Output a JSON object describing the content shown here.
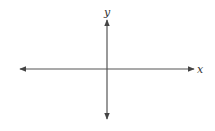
{
  "diagram": {
    "type": "cartesian-axes",
    "x_axis": {
      "label": "x",
      "from": [
        20,
        69
      ],
      "to": [
        194,
        69
      ],
      "arrows": "both"
    },
    "y_axis": {
      "label": "y",
      "from": [
        107,
        119
      ],
      "to": [
        107,
        20
      ],
      "arrows": "both"
    },
    "colors": {
      "axis": "#555555",
      "label": "#333333",
      "background": "#ffffff"
    }
  }
}
